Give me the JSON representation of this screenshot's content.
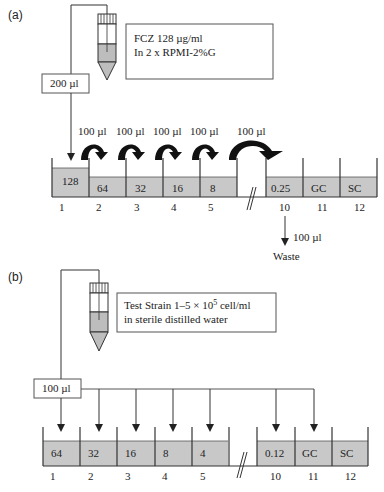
{
  "panel_a": {
    "label": "(a)",
    "reagent_box": {
      "line1": "FCZ 128 µg/ml",
      "line2": "In 2 x RPMI-2%G"
    },
    "transfer_volume": "200 µl",
    "serial_transfer_labels": [
      "100 µl",
      "100 µl",
      "100 µl",
      "100 µl",
      "100 µl"
    ],
    "wells": [
      {
        "number": "1",
        "value": "128"
      },
      {
        "number": "2",
        "value": "64"
      },
      {
        "number": "3",
        "value": "32"
      },
      {
        "number": "4",
        "value": "16"
      },
      {
        "number": "5",
        "value": "8"
      },
      {
        "number": "10",
        "value": "0.25"
      },
      {
        "number": "11",
        "value": "GC"
      },
      {
        "number": "12",
        "value": "SC"
      }
    ],
    "waste": {
      "volume": "100 µl",
      "label": "Waste"
    }
  },
  "panel_b": {
    "label": "(b)",
    "reagent_box": {
      "line1_prefix": "Test Strain 1–5 × 10",
      "line1_exp": "5",
      "line1_suffix": " cell/ml",
      "line2": "in sterile distilled water"
    },
    "transfer_volume": "100 µl",
    "wells": [
      {
        "number": "1",
        "value": "64"
      },
      {
        "number": "2",
        "value": "32"
      },
      {
        "number": "3",
        "value": "16"
      },
      {
        "number": "4",
        "value": "8"
      },
      {
        "number": "5",
        "value": "4"
      },
      {
        "number": "10",
        "value": "0.12"
      },
      {
        "number": "11",
        "value": "GC"
      },
      {
        "number": "12",
        "value": "SC"
      }
    ]
  },
  "colors": {
    "line": "#3a3a3a",
    "fill": "#c8c8c8",
    "tube_fill": "#b9b9b9",
    "box_border": "#555555"
  }
}
